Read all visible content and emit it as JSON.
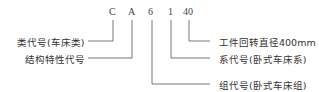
{
  "diagram": {
    "codes": [
      "C",
      "A",
      "6",
      "1",
      "40"
    ],
    "left_labels": [
      {
        "text": "类代号(车床类)",
        "points_to": "C"
      },
      {
        "text": "结构特性代号",
        "points_to": "A"
      }
    ],
    "right_labels": [
      {
        "text": "工件回转直径400mm",
        "points_to": "40"
      },
      {
        "text": "系代号(卧式车床系)",
        "points_to": "1"
      },
      {
        "text": "组代号(卧式车床组)",
        "points_to": "6"
      }
    ],
    "line_color": "#555555"
  }
}
